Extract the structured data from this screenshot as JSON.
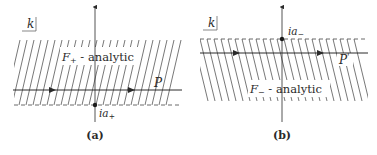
{
  "panels": [
    {
      "id": "a",
      "caption": "(a)",
      "plane_label": "k",
      "region_label_func": "F",
      "region_label_sub": "+",
      "region_label_rest": " - analytic",
      "contour_label": "P",
      "contour_prime": "",
      "point_label_main": "ia",
      "point_label_sub": "+",
      "hatch_direction": "forward-slash",
      "region": "upper half above dashed line"
    },
    {
      "id": "b",
      "caption": "(b)",
      "plane_label": "k",
      "region_label_func": "F",
      "region_label_sub": "−",
      "region_label_rest": " - analytic",
      "contour_label": "P",
      "contour_prime": "'",
      "point_label_main": "ia",
      "point_label_sub": "−",
      "hatch_direction": "back-slash",
      "region": "lower half below dashed line"
    }
  ],
  "colors": {
    "ink": "#2a2a2a",
    "hatch": "#555555",
    "background": "#ffffff"
  }
}
